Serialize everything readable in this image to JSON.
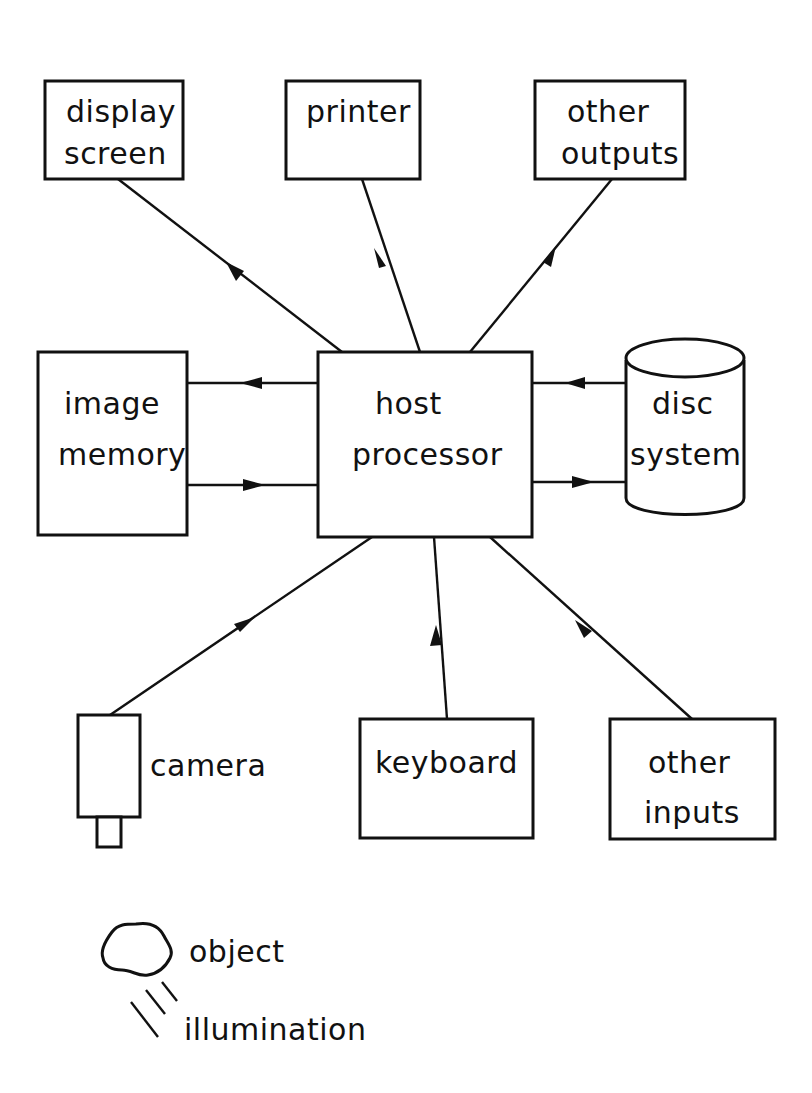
{
  "diagram": {
    "title": "",
    "colors": {
      "ink": "#111111",
      "background": "#ffffff"
    },
    "nodes": {
      "display_screen": {
        "line1": "display",
        "line2": "screen"
      },
      "printer": {
        "line1": "printer"
      },
      "other_outputs": {
        "line1": "other",
        "line2": "outputs"
      },
      "image_memory": {
        "line1": "image",
        "line2": "memory"
      },
      "host_processor": {
        "line1": "host",
        "line2": "processor"
      },
      "disc_system": {
        "line1": "disc",
        "line2": "system"
      },
      "camera": {
        "label": "camera"
      },
      "keyboard": {
        "line1": "keyboard"
      },
      "other_inputs": {
        "line1": "other",
        "line2": "inputs"
      }
    },
    "legend": {
      "object": "object",
      "illumination": "illumination"
    },
    "edges": [
      {
        "from": "host processor",
        "to": "display screen"
      },
      {
        "from": "host processor",
        "to": "printer"
      },
      {
        "from": "host processor",
        "to": "other outputs"
      },
      {
        "from": "host processor",
        "to": "image memory"
      },
      {
        "from": "image memory",
        "to": "host processor"
      },
      {
        "from": "disc system",
        "to": "host processor"
      },
      {
        "from": "host processor",
        "to": "disc system"
      },
      {
        "from": "camera",
        "to": "host processor"
      },
      {
        "from": "keyboard",
        "to": "host processor"
      },
      {
        "from": "other inputs",
        "to": "host processor"
      }
    ]
  }
}
